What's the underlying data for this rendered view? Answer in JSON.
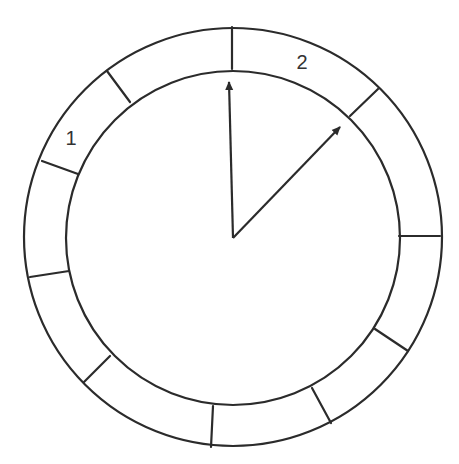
{
  "diagram": {
    "center": [
      233,
      238
    ],
    "outer_radius": 209,
    "inner_radius": 167,
    "colors": {
      "stroke": "#2b2b2b",
      "text": "#333333",
      "background": "#ffffff"
    },
    "segment_count": 10,
    "dividers": [
      {
        "x1": 232,
        "y1": 69,
        "x2": 232,
        "y2": 27
      },
      {
        "x1": 350,
        "y1": 116,
        "x2": 378,
        "y2": 89
      },
      {
        "x1": 399,
        "y1": 236,
        "x2": 440,
        "y2": 236
      },
      {
        "x1": 375,
        "y1": 329,
        "x2": 408,
        "y2": 351
      },
      {
        "x1": 312,
        "y1": 388,
        "x2": 331,
        "y2": 423
      },
      {
        "x1": 213,
        "y1": 406,
        "x2": 211,
        "y2": 447
      },
      {
        "x1": 110,
        "y1": 356,
        "x2": 84,
        "y2": 382
      },
      {
        "x1": 69,
        "y1": 271,
        "x2": 30,
        "y2": 277
      },
      {
        "x1": 78,
        "y1": 174,
        "x2": 42,
        "y2": 161
      },
      {
        "x1": 130,
        "y1": 102,
        "x2": 107,
        "y2": 71
      }
    ],
    "arrows": [
      {
        "name": "arrow-1",
        "x1": 233,
        "y1": 238,
        "x2": 229,
        "y2": 82
      },
      {
        "name": "arrow-2",
        "x1": 233,
        "y1": 238,
        "x2": 340,
        "y2": 127
      }
    ],
    "labels": [
      {
        "text": "1",
        "x": 71,
        "y": 145
      },
      {
        "text": "2",
        "x": 302,
        "y": 69
      }
    ]
  }
}
